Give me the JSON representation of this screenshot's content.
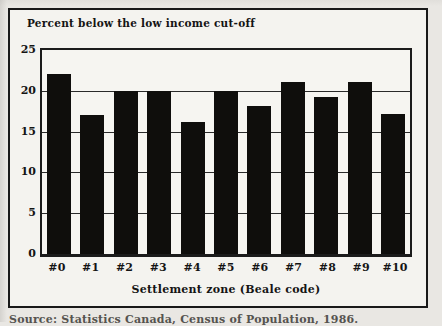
{
  "figure": {
    "caption_clipped": "Source: Statistics Canada, Census of Population, 1986.",
    "colors": {
      "bar": "#0f0e0c",
      "frame": "#191919",
      "gridline": "#2a2a2a",
      "page_background": "#e9e7e3",
      "figure_background": "#f4f3ef"
    }
  },
  "chart_data": {
    "type": "bar",
    "title": "Percent below the low income cut-off",
    "xlabel": "Settlement zone (Beale code)",
    "ylabel": "",
    "categories": [
      "#0",
      "#1",
      "#2",
      "#3",
      "#4",
      "#5",
      "#6",
      "#7",
      "#8",
      "#9",
      "#10"
    ],
    "values": [
      22,
      17,
      20,
      20,
      16.2,
      20,
      18.2,
      21.1,
      19.2,
      21.1,
      17.1
    ],
    "ylim": [
      0,
      25
    ],
    "yticks": [
      0,
      5,
      10,
      15,
      20,
      25
    ],
    "gridlines": [
      5,
      10,
      15,
      20
    ],
    "grid": "horizontal",
    "legend_position": "none",
    "bar_color": "#0f0e0c"
  }
}
